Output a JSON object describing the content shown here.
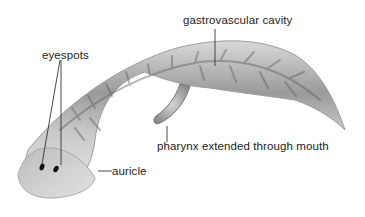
{
  "figure": {
    "labels": {
      "gastrovascular_cavity": "gastrovascular cavity",
      "eyespots": "eyespots",
      "pharynx": "pharynx extended through mouth",
      "auricle": "auricle"
    },
    "colors": {
      "background": "#ffffff",
      "body_light": "#e4e4e4",
      "body_mid": "#b8b8b8",
      "body_dark": "#6a6a6a",
      "eyespot": "#111111",
      "label_text": "#222222",
      "leader_line": "#333333"
    }
  }
}
